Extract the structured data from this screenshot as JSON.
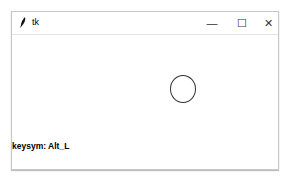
{
  "window": {
    "title": "tk",
    "controls": {
      "minimize": "—",
      "maximize": "☐",
      "close": "✕"
    }
  },
  "canvas": {
    "keysym_label": "keysym: Alt_L",
    "shape": "circle"
  }
}
